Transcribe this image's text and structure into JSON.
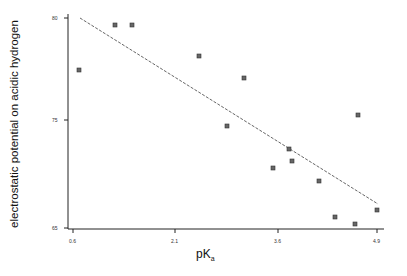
{
  "chart_data": {
    "type": "scatter",
    "title": "",
    "xlabel": "pK",
    "xlabel_subscript": "a",
    "ylabel": "electrostatic potential on acidic hydrogen",
    "x_ticks": [
      {
        "label": "0.6",
        "px": 73
      },
      {
        "label": "2.1",
        "px": 175
      },
      {
        "label": "3.6",
        "px": 278
      },
      {
        "label": "4.9",
        "px": 377
      }
    ],
    "y_ticks": [
      {
        "label": "80",
        "px": 18
      },
      {
        "label": "75",
        "px": 120
      },
      {
        "label": "65",
        "px": 228
      }
    ],
    "xlim": [
      0.5,
      5.0
    ],
    "ylim": [
      65,
      80.5
    ],
    "grid": false,
    "legend": null,
    "series": [
      {
        "name": "compounds",
        "marker": "square",
        "points": [
          {
            "x": 0.66,
            "y": 77.5
          },
          {
            "x": 1.2,
            "y": 79.7
          },
          {
            "x": 1.4,
            "y": 79.7
          },
          {
            "x": 2.45,
            "y": 78.5
          },
          {
            "x": 2.8,
            "y": 74.6
          },
          {
            "x": 3.05,
            "y": 77.4
          },
          {
            "x": 3.5,
            "y": 71.6
          },
          {
            "x": 3.75,
            "y": 72.9
          },
          {
            "x": 3.77,
            "y": 72.3
          },
          {
            "x": 4.2,
            "y": 71.0
          },
          {
            "x": 4.4,
            "y": 69.3
          },
          {
            "x": 4.68,
            "y": 68.9
          },
          {
            "x": 4.7,
            "y": 75.8
          },
          {
            "x": 4.9,
            "y": 69.6
          }
        ],
        "pixels": [
          [
            79,
            70
          ],
          [
            115,
            25
          ],
          [
            132,
            25
          ],
          [
            199,
            56
          ],
          [
            227,
            126
          ],
          [
            244,
            78
          ],
          [
            273,
            168
          ],
          [
            289,
            149
          ],
          [
            292,
            161
          ],
          [
            319,
            181
          ],
          [
            335,
            217
          ],
          [
            355,
            224
          ],
          [
            358,
            115
          ],
          [
            377,
            210
          ]
        ]
      }
    ],
    "fit_line": {
      "style": "dashed",
      "from_px": [
        80,
        18
      ],
      "to_px": [
        378,
        204
      ]
    }
  }
}
